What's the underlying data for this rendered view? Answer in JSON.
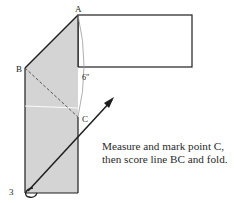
{
  "figure": {
    "step_number": "3",
    "labels": {
      "point_a": "A",
      "point_b": "B",
      "point_c": "C",
      "measurement": "6″"
    },
    "caption": "Measure and mark point C, then score line BC and fold.",
    "colors": {
      "shaded_panel": "#d4d4d4",
      "outline": "#1e1e1e",
      "measure_arc": "#9a9a9a",
      "background": "#ffffff"
    }
  }
}
